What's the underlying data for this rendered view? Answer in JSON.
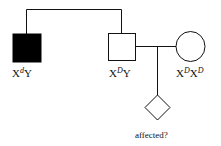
{
  "diagram": {
    "type": "pedigree",
    "colors": {
      "line": "#111111",
      "affected_fill": "#000000",
      "unaffected_fill": "#ffffff"
    },
    "individuals": [
      {
        "id": "grandparent-son-affected",
        "shape": "square",
        "affected": true,
        "genotype_base1": "X",
        "genotype_sup1": "d",
        "genotype_base2": "Y",
        "genotype_sup2": ""
      },
      {
        "id": "father",
        "shape": "square",
        "affected": false,
        "genotype_base1": "X",
        "genotype_sup1": "D",
        "genotype_base2": "Y",
        "genotype_sup2": ""
      },
      {
        "id": "mother",
        "shape": "circle",
        "affected": false,
        "genotype_base1": "X",
        "genotype_sup1": "D",
        "genotype_base2": "X",
        "genotype_sup2": "D"
      },
      {
        "id": "child",
        "shape": "diamond",
        "affected": null,
        "label": "affected?"
      }
    ]
  }
}
